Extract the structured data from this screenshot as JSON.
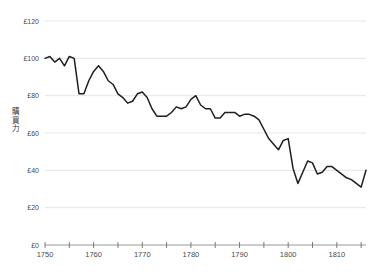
{
  "chart_data": {
    "type": "line",
    "title": "",
    "subtitle": "",
    "xlabel": "",
    "ylabel": "購買力",
    "ylabel_chars": [
      "購",
      "買",
      "力"
    ],
    "currency_symbol": "£",
    "xlim": [
      1750,
      1816
    ],
    "ylim": [
      0,
      120
    ],
    "grid": true,
    "legend": "none",
    "y_ticks": [
      0,
      20,
      40,
      60,
      80,
      100,
      120
    ],
    "y_tick_labels": [
      "£0",
      "£20",
      "£40",
      "£60",
      "£80",
      "£100",
      "£120"
    ],
    "x_ticks_major": [
      1750,
      1760,
      1770,
      1780,
      1790,
      1800,
      1810
    ],
    "x_tick_labels": [
      "1750",
      "1760",
      "1770",
      "1780",
      "1790",
      "1800",
      "1810"
    ],
    "x_ticks_minor": [
      1755,
      1765,
      1775,
      1785,
      1795,
      1805,
      1815
    ],
    "series": [
      {
        "name": "購買力",
        "color": "#1f1f1f",
        "x": [
          1750,
          1751,
          1752,
          1753,
          1754,
          1755,
          1756,
          1757,
          1758,
          1759,
          1760,
          1761,
          1762,
          1763,
          1764,
          1765,
          1766,
          1767,
          1768,
          1769,
          1770,
          1771,
          1772,
          1773,
          1774,
          1775,
          1776,
          1777,
          1778,
          1779,
          1780,
          1781,
          1782,
          1783,
          1784,
          1785,
          1786,
          1787,
          1788,
          1789,
          1790,
          1791,
          1792,
          1793,
          1794,
          1795,
          1796,
          1797,
          1798,
          1799,
          1800,
          1801,
          1802,
          1803,
          1804,
          1805,
          1806,
          1807,
          1808,
          1809,
          1810,
          1811,
          1812,
          1813,
          1814,
          1815,
          1816
        ],
        "values": [
          100,
          101,
          98,
          100,
          96,
          101,
          100,
          81,
          81,
          88,
          93,
          96,
          93,
          88,
          86,
          81,
          79,
          76,
          77,
          81,
          82,
          79,
          73,
          69,
          69,
          69,
          71,
          74,
          73,
          74,
          78,
          80,
          75,
          73,
          73,
          68,
          68,
          71,
          71,
          71,
          69,
          70,
          70,
          69,
          67,
          62,
          57,
          54,
          51,
          56,
          57,
          41,
          33,
          39,
          45,
          44,
          38,
          39,
          42,
          42,
          40,
          38,
          36,
          35,
          33,
          31,
          40
        ]
      }
    ]
  }
}
